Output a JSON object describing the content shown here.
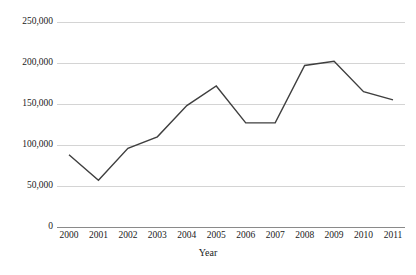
{
  "chart_data": {
    "type": "line",
    "title": "",
    "xlabel": "Year",
    "ylabel": "",
    "categories": [
      "2000",
      "2001",
      "2002",
      "2003",
      "2004",
      "2005",
      "2006",
      "2007",
      "2008",
      "2009",
      "2010",
      "2011"
    ],
    "series": [
      {
        "name": "",
        "values": [
          88000,
          57000,
          96000,
          110000,
          148000,
          172000,
          127000,
          127000,
          197000,
          202000,
          165000,
          155000
        ]
      }
    ],
    "ylim": [
      0,
      250000
    ],
    "yticks": [
      0,
      50000,
      100000,
      150000,
      200000,
      250000
    ],
    "ytick_labels": [
      "0",
      "50,000",
      "100,000",
      "150,000",
      "200,000",
      "250,000"
    ],
    "xtick_labels": [
      "2000",
      "2001",
      "2002",
      "2003",
      "2004",
      "2005",
      "2006",
      "2007",
      "2008",
      "2009",
      "2010",
      "2011"
    ],
    "grid": true,
    "grid_axis": "y",
    "legend": false,
    "legend_position": "none",
    "line_color": "#3f3f3f",
    "grid_color": "#d4d4d4",
    "axis_color": "#8a8a8a",
    "background_color": "#ffffff"
  }
}
